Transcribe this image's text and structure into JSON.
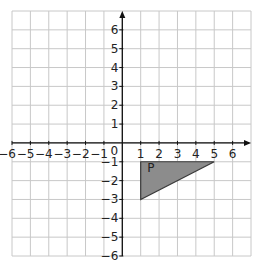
{
  "chart_data": {
    "type": "scatter",
    "title": "",
    "xlabel": "",
    "ylabel": "",
    "xlim": [
      -6,
      6
    ],
    "ylim": [
      -6,
      6
    ],
    "grid": true,
    "origin_label": "0",
    "x_ticks": [
      -6,
      -5,
      -4,
      -3,
      -2,
      -1,
      1,
      2,
      3,
      4,
      5,
      6
    ],
    "y_ticks": [
      6,
      5,
      4,
      3,
      2,
      1,
      -1,
      -2,
      -3,
      -4,
      -5,
      -6
    ],
    "shapes": [
      {
        "label": "P",
        "kind": "triangle",
        "vertices": [
          [
            1,
            -1
          ],
          [
            5,
            -1
          ],
          [
            1,
            -3
          ]
        ],
        "fill": "#8c8c8c",
        "stroke": "#3a3a3a"
      }
    ]
  },
  "colors": {
    "grid": "#c8c8c8",
    "axis": "#111111",
    "shape_fill": "#8c8c8c"
  }
}
